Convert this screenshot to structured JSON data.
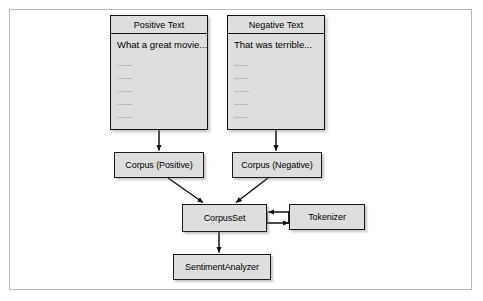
{
  "figure": {
    "type": "flow-diagram",
    "background_color": "#ffffff",
    "frame_color": "#b9b9b9",
    "node_fill": "#dedede",
    "node_border": "#1a1a1a",
    "arrow_color": "#111111"
  },
  "documents": [
    {
      "id": "positive-text",
      "title": "Positive Text",
      "first_line": "What a great movie...",
      "ellipsis_lines": [
        "......",
        "......",
        "......",
        "......",
        "......"
      ]
    },
    {
      "id": "negative-text",
      "title": "Negative Text",
      "first_line": "That was terrible...",
      "ellipsis_lines": [
        "......",
        "......",
        "......",
        "......",
        "......"
      ]
    }
  ],
  "nodes": {
    "corpus_positive": "Corpus (Positive)",
    "corpus_negative": "Corpus (Negative)",
    "corpus_set": "CorpusSet",
    "tokenizer": "Tokenizer",
    "sentiment_analyzer": "SentimentAnalyzer"
  },
  "edges": [
    {
      "from": "positive-text",
      "to": "corpus_positive",
      "style": "vertical-arrow"
    },
    {
      "from": "negative-text",
      "to": "corpus_negative",
      "style": "vertical-arrow"
    },
    {
      "from": "corpus_positive",
      "to": "corpus_set",
      "style": "diagonal-arrow"
    },
    {
      "from": "corpus_negative",
      "to": "corpus_set",
      "style": "diagonal-arrow"
    },
    {
      "from": "tokenizer",
      "to": "corpus_set",
      "style": "horizontal-arrow-left"
    },
    {
      "from": "corpus_set",
      "to": "tokenizer",
      "style": "horizontal-arrow-right"
    },
    {
      "from": "corpus_set",
      "to": "sentiment_analyzer",
      "style": "vertical-arrow"
    }
  ]
}
